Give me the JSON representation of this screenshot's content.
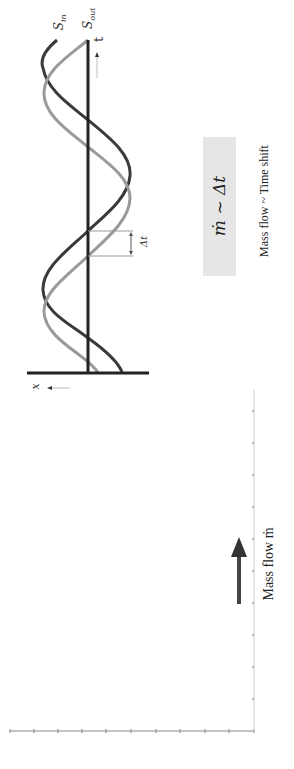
{
  "signal_plot": {
    "series": [
      {
        "name": "S_in",
        "label_main": "S",
        "label_sub": "in",
        "color": "#3a3a3a"
      },
      {
        "name": "S_out",
        "label_main": "S",
        "label_sub": "out",
        "color": "#9a9a9a"
      }
    ],
    "time_axis_label": "t",
    "position_axis_label": "x",
    "delta_label": "Δt"
  },
  "formula_box": {
    "text": "ṁ ~ Δt",
    "background": "#e6e6e6"
  },
  "caption": "Mass flow ~ Time shift",
  "flow_arrow": {
    "label": "Mass flow ṁ",
    "color": "#333333"
  },
  "ruler": {
    "horizontal_ticks": 11,
    "vertical_ticks": 8
  }
}
